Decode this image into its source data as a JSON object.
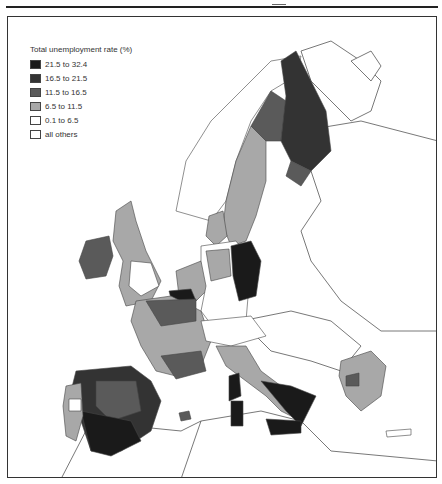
{
  "legend": {
    "title": "Total unemployment rate (%)",
    "items": [
      {
        "label": "21.5 to 32.4",
        "color": "#1a1a1a"
      },
      {
        "label": "16.5 to 21.5",
        "color": "#333333"
      },
      {
        "label": "11.5 to 16.5",
        "color": "#5a5a5a"
      },
      {
        "label": "6.5 to 11.5",
        "color": "#a8a8a8"
      },
      {
        "label": "0.1 to 6.5",
        "color": "#ffffff"
      },
      {
        "label": "all others",
        "color": "#ffffff"
      }
    ]
  },
  "map": {
    "subject": "Regional total unemployment rate, European Union",
    "shading": {
      "darkest": [
        "Southern Spain (Andalusia, Extremadura)",
        "Southern Italy",
        "Sicily",
        "Sardinia",
        "Eastern Germany (parts)"
      ],
      "dark": [
        "Northern Spain",
        "Eastern Spain",
        "Finland (north/east)",
        "Eastern Germany",
        "Northern France/Belgium border"
      ],
      "medium": [
        "Ireland",
        "Central Spain",
        "Finland (west)",
        "Southern France",
        "Greece (north)"
      ],
      "light": [
        "Sweden",
        "UK (many regions)",
        "France",
        "Denmark",
        "Northern Germany",
        "Italy (center)",
        "Greece",
        "Portugal (parts)"
      ],
      "white": [
        "Southern Germany",
        "Austria",
        "Northern Italy",
        "Non-EU countries"
      ]
    }
  }
}
